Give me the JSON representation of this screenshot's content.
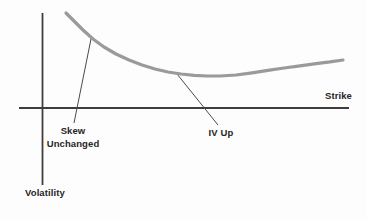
{
  "figure": {
    "background_color": "#fdfdfd",
    "axis_color": "#3e3e3e",
    "leader_color": "#4a4a4a",
    "text_color": "#262626"
  },
  "chart_data": {
    "type": "line",
    "title": "",
    "xlabel": "Strike",
    "ylabel": "Volatility",
    "grid": false,
    "legend": false,
    "x_axis": {
      "label": "Strike",
      "ticks": []
    },
    "y_axis": {
      "label": "Volatility",
      "ticks": []
    },
    "series": [
      {
        "name": "implied volatility skew curve (IV up, skew unchanged)",
        "color": "#9a9a9a",
        "stroke_width": 3.2,
        "points_px": [
          [
            66,
            13
          ],
          [
            74,
            21
          ],
          [
            83,
            30
          ],
          [
            93,
            39
          ],
          [
            104,
            47
          ],
          [
            116,
            54
          ],
          [
            129,
            60
          ],
          [
            142,
            65
          ],
          [
            155,
            69
          ],
          [
            168,
            72
          ],
          [
            181,
            74
          ],
          [
            194,
            75.3
          ],
          [
            207,
            76
          ],
          [
            220,
            76
          ],
          [
            236,
            75
          ],
          [
            252,
            72.8
          ],
          [
            268,
            70.3
          ],
          [
            284,
            68
          ],
          [
            300,
            65.8
          ],
          [
            316,
            63.6
          ],
          [
            330,
            61.9
          ],
          [
            343,
            60
          ]
        ]
      }
    ],
    "annotations": [
      {
        "id": "skew-unchanged",
        "lines": [
          "Skew",
          "Unchanged"
        ],
        "text_px": [
          73,
          125
        ],
        "leader": [
          [
            91,
            39
          ],
          [
            74,
            123
          ]
        ]
      },
      {
        "id": "iv-up",
        "lines": [
          "IV Up"
        ],
        "text_px": [
          221,
          127
        ],
        "leader": [
          [
            177,
            74
          ],
          [
            218,
            125
          ]
        ]
      }
    ],
    "axes_px": {
      "x_axis": [
        [
          19,
          108
        ],
        [
          349,
          108
        ]
      ],
      "y_axis": [
        [
          42.5,
          13
        ],
        [
          42.5,
          185
        ]
      ]
    },
    "labels_px": {
      "strike": {
        "x": 352,
        "y": 90,
        "align": "right"
      },
      "volatility": {
        "x": 25,
        "y": 187,
        "align": "left"
      }
    }
  }
}
